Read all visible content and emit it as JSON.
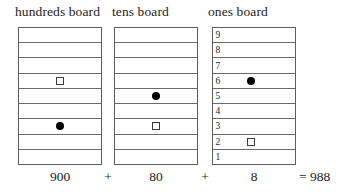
{
  "boards": [
    {
      "id": "hundreds",
      "title": "hundreds board",
      "rows_total": 9,
      "numbered": false,
      "row_labels": [
        "",
        "",
        "",
        "",
        "",
        "",
        "",
        "",
        ""
      ],
      "markers": [
        {
          "type": "square",
          "row_from_top": 4
        },
        {
          "type": "dot",
          "row_from_top": 7
        }
      ],
      "value_label": "900"
    },
    {
      "id": "tens",
      "title": "tens board",
      "rows_total": 9,
      "numbered": false,
      "row_labels": [
        "",
        "",
        "",
        "",
        "",
        "",
        "",
        "",
        ""
      ],
      "markers": [
        {
          "type": "dot",
          "row_from_top": 5
        },
        {
          "type": "square",
          "row_from_top": 7
        }
      ],
      "value_label": "80"
    },
    {
      "id": "ones",
      "title": "ones board",
      "rows_total": 9,
      "numbered": true,
      "row_labels": [
        "9",
        "8",
        "7",
        "6",
        "5",
        "4",
        "3",
        "2",
        "1"
      ],
      "markers": [
        {
          "type": "dot",
          "row_from_top": 4
        },
        {
          "type": "square",
          "row_from_top": 8
        }
      ],
      "value_label": "8"
    }
  ],
  "equation": {
    "hundreds_value": "900",
    "plus_1": "+",
    "tens_value": "80",
    "plus_2": "+",
    "ones_value": "8",
    "total": "= 988"
  },
  "colors": {
    "background": "#ffffff",
    "text": "#1c1c1c",
    "grid_line": "#6a6a6a",
    "border": "#5d5d5d",
    "dot_fill": "#000000",
    "square_stroke": "#3a3a3a"
  }
}
